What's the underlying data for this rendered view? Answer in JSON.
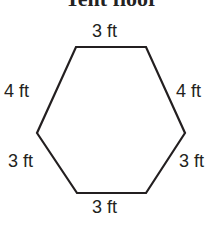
{
  "title": "Tent floor",
  "shape": "hexagon",
  "sides": {
    "top": "3 ft",
    "upper_left": "4 ft",
    "upper_right": "4 ft",
    "lower_left": "3 ft",
    "lower_right": "3 ft",
    "bottom": "3 ft"
  },
  "colors": {
    "stroke": "#231f20",
    "text": "#231f20"
  }
}
